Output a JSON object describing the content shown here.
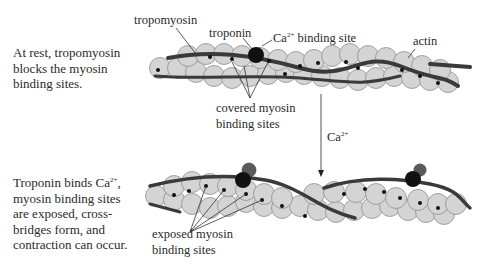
{
  "figure": {
    "rest_state": {
      "caption_lines": [
        "At rest, tropomyosin",
        "blocks the myosin",
        "binding sites."
      ],
      "labels": {
        "tropomyosin": "tropomyosin",
        "troponin": "troponin",
        "ca_binding_site_prefix": "Ca",
        "ca_binding_site_sup": "2+",
        "ca_binding_site_suffix": " binding site",
        "actin": "actin",
        "covered_line1": "covered myosin",
        "covered_line2": "binding sites"
      }
    },
    "transition": {
      "arrow_label_prefix": "Ca",
      "arrow_label_sup": "2+"
    },
    "active_state": {
      "caption_line1_prefix": "Troponin binds Ca",
      "caption_line1_sup": "2+",
      "caption_line1_suffix": ",",
      "caption_lines": [
        "myosin binding sites",
        "are exposed, cross-",
        "bridges form, and",
        "contraction can occur."
      ],
      "labels": {
        "exposed_line1": "exposed myosin",
        "exposed_line2": "binding sites"
      }
    },
    "colors": {
      "actin_fill": "#d4d4d4",
      "actin_stroke": "#8a8a8a",
      "tropomyosin": "#3a3a3a",
      "troponin": "#111111",
      "calcium": "#6a6a6a",
      "binding_site": "#111111"
    }
  }
}
